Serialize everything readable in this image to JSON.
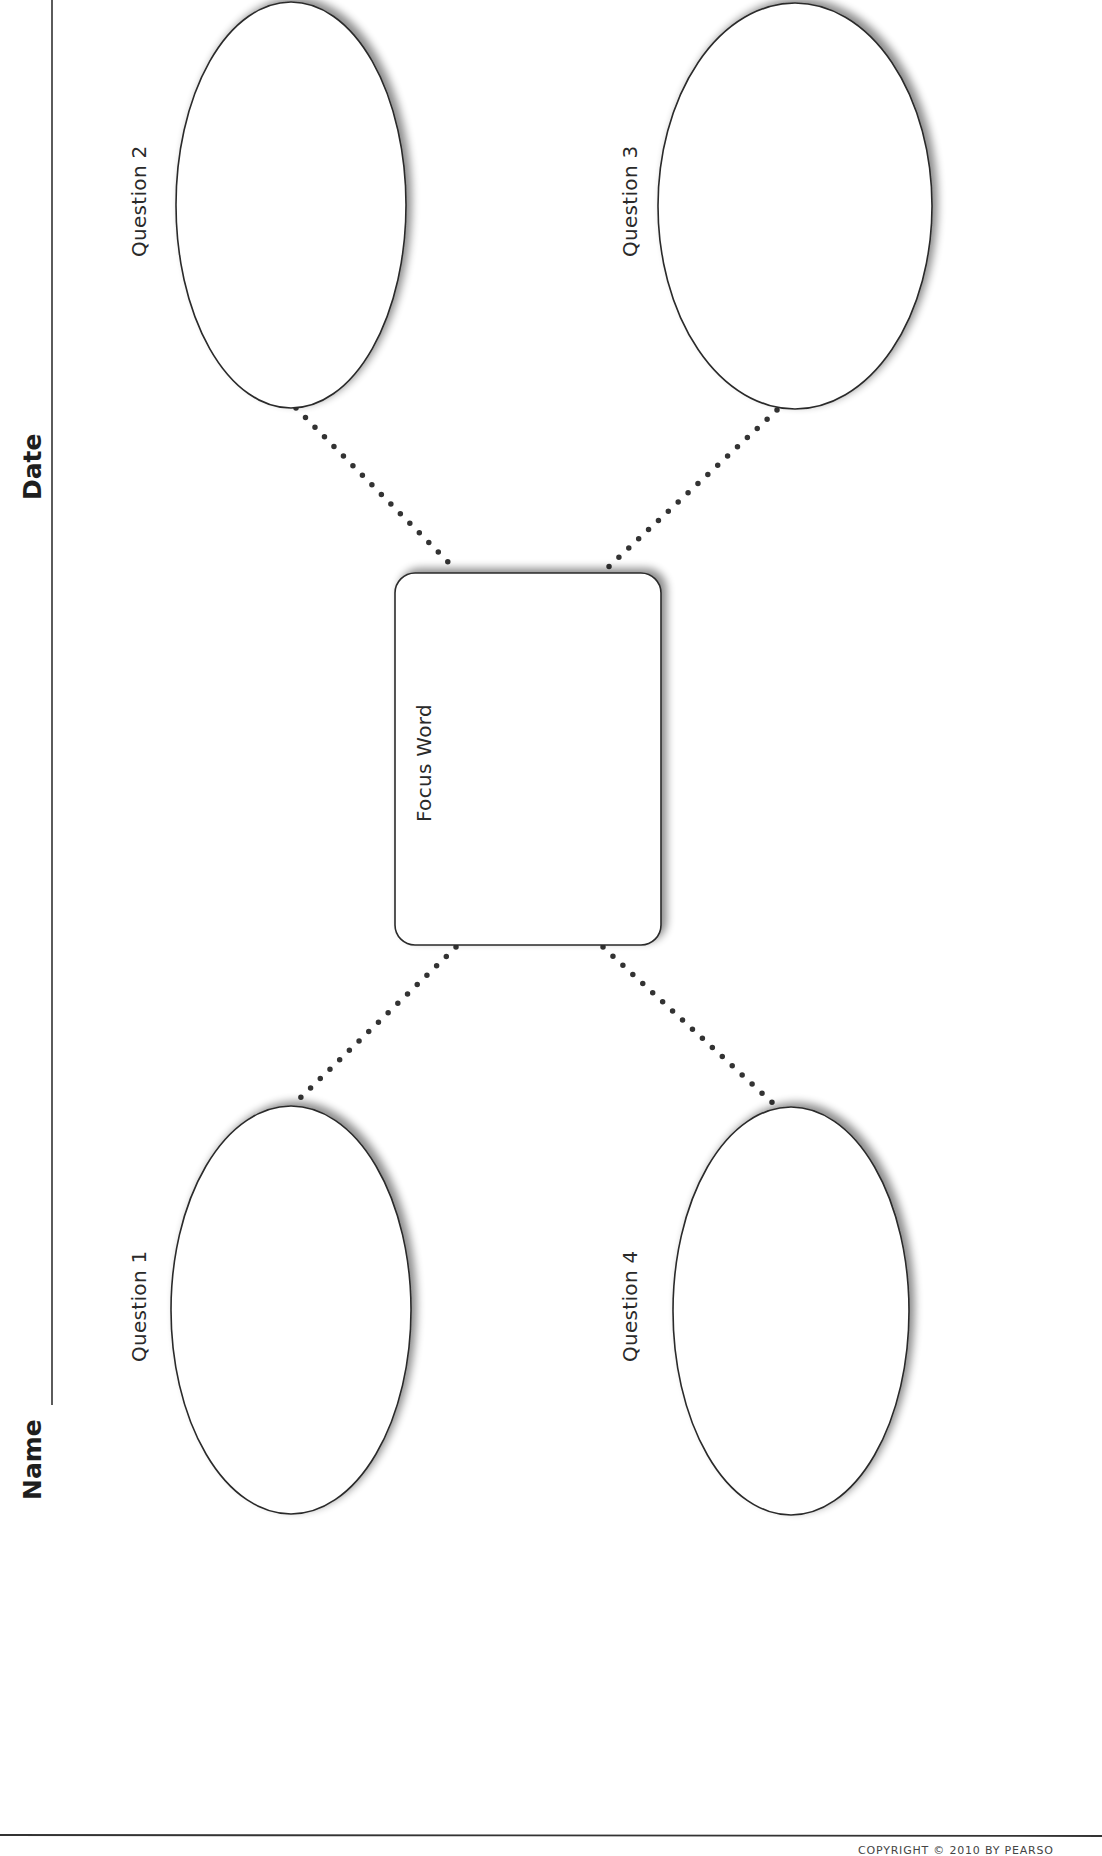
{
  "header": {
    "name_label": "Name",
    "date_label": "Date"
  },
  "organizer": {
    "center": {
      "label": "Focus Word"
    },
    "questions": [
      {
        "id": 1,
        "label": "Question 1"
      },
      {
        "id": 2,
        "label": "Question 2"
      },
      {
        "id": 3,
        "label": "Question 3"
      },
      {
        "id": 4,
        "label": "Question 4"
      }
    ]
  },
  "footer": {
    "copyright": "COPYRIGHT © 2010 BY PEARSO"
  },
  "colors": {
    "ink": "#2a2a2a",
    "shadow": "#9a9a9a",
    "background": "#ffffff"
  }
}
